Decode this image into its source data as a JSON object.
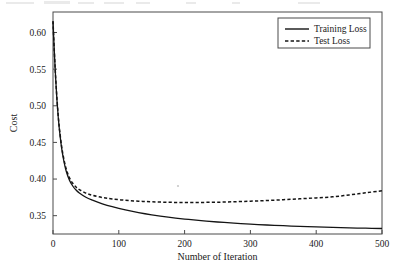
{
  "chart_data": {
    "type": "line",
    "title": "",
    "xlabel": "Number of Iteration",
    "ylabel": "Cost",
    "xlim": [
      0,
      500
    ],
    "ylim": [
      0.325,
      0.628
    ],
    "xticks": [
      0,
      100,
      200,
      300,
      400,
      500
    ],
    "yticks": [
      0.35,
      0.4,
      0.45,
      0.5,
      0.55,
      0.6
    ],
    "xtick_labels": [
      "0",
      "100",
      "200",
      "300",
      "400",
      "500"
    ],
    "ytick_labels": [
      "0.35",
      "0.40",
      "0.45",
      "0.50",
      "0.55",
      "0.60"
    ],
    "grid": false,
    "legend_position": "top-right",
    "frame": true,
    "x": [
      0,
      2,
      4,
      6,
      8,
      10,
      13,
      16,
      20,
      25,
      30,
      35,
      40,
      50,
      60,
      75,
      90,
      110,
      130,
      150,
      175,
      200,
      225,
      250,
      275,
      300,
      325,
      350,
      375,
      400,
      425,
      450,
      475,
      500
    ],
    "series": [
      {
        "name": "Training Loss",
        "style": "solid",
        "color": "#141414",
        "values": [
          0.6155,
          0.574,
          0.538,
          0.508,
          0.484,
          0.465,
          0.443,
          0.427,
          0.411,
          0.3985,
          0.3905,
          0.385,
          0.381,
          0.3752,
          0.3712,
          0.3662,
          0.3622,
          0.3578,
          0.3542,
          0.3512,
          0.348,
          0.3454,
          0.3432,
          0.3414,
          0.3398,
          0.3385,
          0.3373,
          0.3363,
          0.3354,
          0.3346,
          0.334,
          0.3334,
          0.3329,
          0.3325
        ]
      },
      {
        "name": "Test Loss",
        "style": "dashed",
        "color": "#141414",
        "values": [
          0.6155,
          0.5745,
          0.539,
          0.5095,
          0.4858,
          0.467,
          0.4452,
          0.4295,
          0.414,
          0.4018,
          0.3942,
          0.3892,
          0.3856,
          0.3808,
          0.3778,
          0.3748,
          0.3728,
          0.371,
          0.3698,
          0.369,
          0.3683,
          0.368,
          0.3681,
          0.3684,
          0.369,
          0.3698,
          0.3707,
          0.3718,
          0.373,
          0.3743,
          0.3757,
          0.3783,
          0.3812,
          0.384
        ]
      }
    ],
    "legend": [
      {
        "label": "Training Loss",
        "style": "solid"
      },
      {
        "label": "Test Loss",
        "style": "dashed"
      }
    ]
  }
}
